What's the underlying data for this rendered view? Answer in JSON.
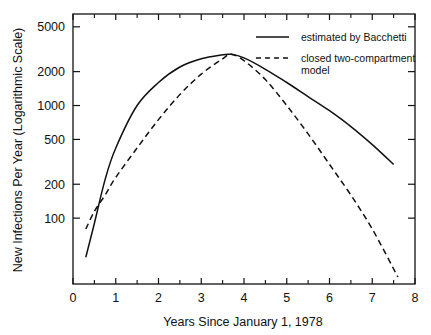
{
  "chart_data": {
    "type": "line",
    "title": "",
    "xlabel": "Years Since January 1, 1978",
    "ylabel": "New Infections Per Year (Logarithmic Scale)",
    "xlim": [
      0,
      8
    ],
    "ylim": [
      26,
      6500
    ],
    "yscale": "log",
    "grid": false,
    "legend_position": "upper right",
    "x_ticks": [
      0,
      1,
      2,
      3,
      4,
      5,
      6,
      7,
      8
    ],
    "x_minor_ticks": [
      0.5,
      1.5,
      2.5,
      3.5,
      4.5,
      5.5,
      6.5,
      7.5
    ],
    "y_ticks": [
      100,
      200,
      500,
      1000,
      2000,
      5000
    ],
    "y_tick_labels": [
      "100",
      "200",
      "500",
      "1000",
      "2000",
      "5000"
    ],
    "series": [
      {
        "name": "estimated by  Bacchetti",
        "style": "solid",
        "x": [
          0.3,
          0.5,
          0.75,
          1.0,
          1.5,
          2.0,
          2.5,
          3.0,
          3.5,
          3.7,
          4.0,
          4.5,
          5.0,
          5.5,
          6.0,
          6.5,
          7.0,
          7.5
        ],
        "values": [
          45,
          90,
          220,
          420,
          1000,
          1600,
          2200,
          2600,
          2820,
          2850,
          2650,
          2100,
          1600,
          1200,
          900,
          650,
          450,
          300
        ]
      },
      {
        "name": "closed two-compartment model",
        "style": "dashed",
        "x": [
          0.3,
          0.5,
          0.75,
          1.0,
          1.5,
          2.0,
          2.5,
          3.0,
          3.5,
          3.7,
          4.0,
          4.5,
          5.0,
          5.5,
          6.0,
          6.5,
          7.0,
          7.6
        ],
        "values": [
          80,
          115,
          160,
          230,
          420,
          750,
          1250,
          1900,
          2600,
          2850,
          2500,
          1700,
          1000,
          560,
          300,
          160,
          80,
          30
        ]
      }
    ]
  },
  "legend": {
    "items": [
      {
        "label_lines": [
          "estimated by  Bacchetti"
        ],
        "style": "solid"
      },
      {
        "label_lines": [
          "closed two-compartment",
          "model"
        ],
        "style": "dashed"
      }
    ]
  }
}
